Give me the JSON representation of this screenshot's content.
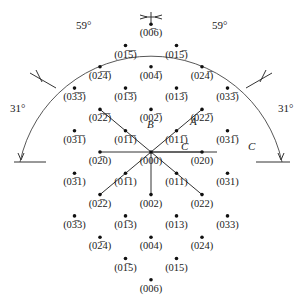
{
  "center": {
    "x": 151,
    "y": 152
  },
  "scale": {
    "k_px": 25.5,
    "l_px": 21.3
  },
  "spots": [
    {
      "k": 0,
      "l": -6,
      "label": "(00̅6)",
      "bar": "(0 0 -6)"
    },
    {
      "k": -1,
      "l": -5,
      "label": "(01̅5̅)"
    },
    {
      "k": 1,
      "l": -5,
      "label": "(015̅)"
    },
    {
      "k": -2,
      "l": -4,
      "label": "(02̅4̅)"
    },
    {
      "k": 0,
      "l": -4,
      "label": "(004̅)"
    },
    {
      "k": 2,
      "l": -4,
      "label": "(024̅)"
    },
    {
      "k": -3,
      "l": -3,
      "label": "(03̅3̅)"
    },
    {
      "k": -1,
      "l": -3,
      "label": "(01̅3̅)"
    },
    {
      "k": 1,
      "l": -3,
      "label": "(013̅)"
    },
    {
      "k": 3,
      "l": -3,
      "label": "(033̅)"
    },
    {
      "k": -2,
      "l": -2,
      "label": "(02̅2̅)"
    },
    {
      "k": 0,
      "l": -2,
      "label": "(002̅)"
    },
    {
      "k": 2,
      "l": -2,
      "label": "(022̅)"
    },
    {
      "k": -3,
      "l": -1,
      "label": "(03̅1̅)"
    },
    {
      "k": -1,
      "l": -1,
      "label": "(01̅1̅)"
    },
    {
      "k": 1,
      "l": -1,
      "label": "(011̅)"
    },
    {
      "k": 3,
      "l": -1,
      "label": "(031̅)"
    },
    {
      "k": -2,
      "l": 0,
      "label": "(02̅0)"
    },
    {
      "k": 0,
      "l": 0,
      "label": "(000)"
    },
    {
      "k": 2,
      "l": 0,
      "label": "(020)"
    },
    {
      "k": -3,
      "l": 1,
      "label": "(03̅1)"
    },
    {
      "k": -1,
      "l": 1,
      "label": "(01̅1)"
    },
    {
      "k": 1,
      "l": 1,
      "label": "(011)"
    },
    {
      "k": 3,
      "l": 1,
      "label": "(031)"
    },
    {
      "k": -2,
      "l": 2,
      "label": "(02̅2)"
    },
    {
      "k": 0,
      "l": 2,
      "label": "(002)"
    },
    {
      "k": 2,
      "l": 2,
      "label": "(022)"
    },
    {
      "k": -3,
      "l": 3,
      "label": "(03̅3)"
    },
    {
      "k": -1,
      "l": 3,
      "label": "(01̅3)"
    },
    {
      "k": 1,
      "l": 3,
      "label": "(013)"
    },
    {
      "k": 3,
      "l": 3,
      "label": "(033)"
    },
    {
      "k": -2,
      "l": 4,
      "label": "(02̅4)"
    },
    {
      "k": 0,
      "l": 4,
      "label": "(004)"
    },
    {
      "k": 2,
      "l": 4,
      "label": "(024)"
    },
    {
      "k": -1,
      "l": 5,
      "label": "(01̅5)"
    },
    {
      "k": 1,
      "l": 5,
      "label": "(015)"
    },
    {
      "k": 0,
      "l": 6,
      "label": "(006)"
    }
  ],
  "rays": [
    {
      "k": -2,
      "l": -2
    },
    {
      "k": 2,
      "l": -2
    },
    {
      "k": -2,
      "l": 0
    },
    {
      "k": 2,
      "l": 0
    },
    {
      "k": -2,
      "l": 2
    },
    {
      "k": 2,
      "l": 2
    },
    {
      "k": 0,
      "l": 2
    }
  ],
  "axis_labels": {
    "A": "A",
    "B": "B",
    "C_inner": "C",
    "C_outer": "C"
  },
  "angles": {
    "top_left": "59°",
    "top_right": "59°",
    "left": "31°",
    "right": "31°"
  }
}
